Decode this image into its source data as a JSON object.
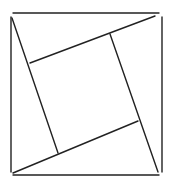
{
  "diagram": {
    "type": "geometric-figure",
    "stroke_color": "#222222",
    "background": "#ffffff",
    "outer_square": {
      "top": {
        "x1": 13,
        "y1": 13,
        "x2": 159,
        "y2": 13
      },
      "left": {
        "x1": 11,
        "y1": 17,
        "x2": 11,
        "y2": 172
      },
      "bottom": {
        "x1": 13,
        "y1": 175,
        "x2": 159,
        "y2": 175
      },
      "right": {
        "x1": 162,
        "y1": 17,
        "x2": 162,
        "y2": 172
      }
    },
    "inner_segments": [
      {
        "name": "left-diagonal",
        "x1": 12,
        "y1": 18,
        "x2": 58,
        "y2": 153
      },
      {
        "name": "top-slant",
        "x1": 30,
        "y1": 63,
        "x2": 155,
        "y2": 16
      },
      {
        "name": "right-diagonal",
        "x1": 110,
        "y1": 34,
        "x2": 158,
        "y2": 172
      },
      {
        "name": "bottom-slant",
        "x1": 13,
        "y1": 173,
        "x2": 138,
        "y2": 121
      }
    ]
  }
}
